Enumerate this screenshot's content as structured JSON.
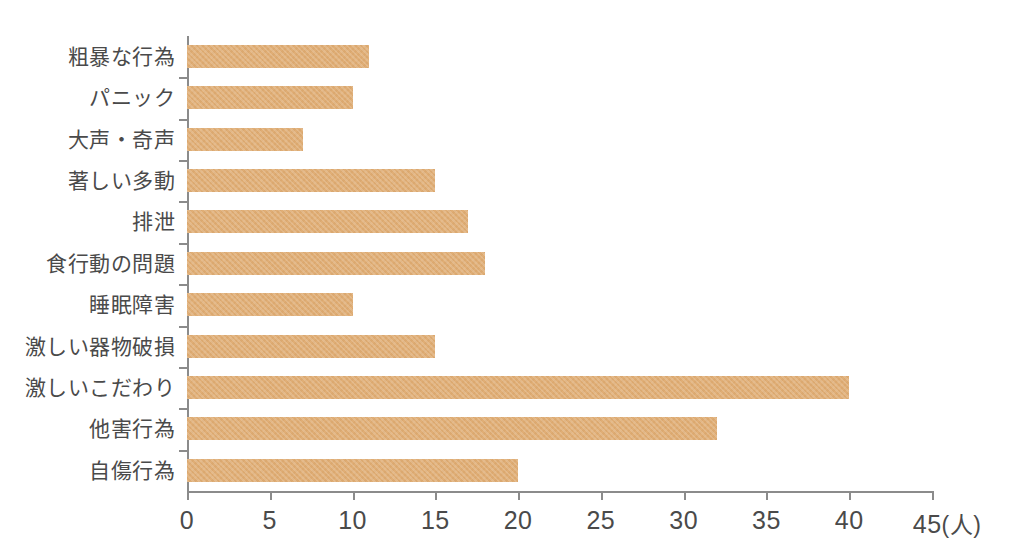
{
  "chart_data": {
    "type": "bar",
    "orientation": "horizontal",
    "title": "",
    "subtitle": "",
    "xlabel": "",
    "ylabel": "",
    "unit_label": "(人)",
    "xlim": [
      0,
      45
    ],
    "xticks": [
      0,
      5,
      10,
      15,
      20,
      25,
      30,
      35,
      40,
      45
    ],
    "xtick_labels": [
      "0",
      "5",
      "10",
      "15",
      "20",
      "25",
      "30",
      "35",
      "40",
      "45"
    ],
    "grid": false,
    "legend": null,
    "bar_color": "#e0ae76",
    "axis_color": "#8b8b8b",
    "text_color": "#4a4a4a",
    "categories": [
      "粗暴な行為",
      "パニック",
      "大声・奇声",
      "著しい多動",
      "排泄",
      "食行動の問題",
      "睡眠障害",
      "激しい器物破損",
      "激しいこだわり",
      "他害行為",
      "自傷行為"
    ],
    "values": [
      11,
      10,
      7,
      15,
      17,
      18,
      10,
      15,
      40,
      32,
      20
    ]
  }
}
